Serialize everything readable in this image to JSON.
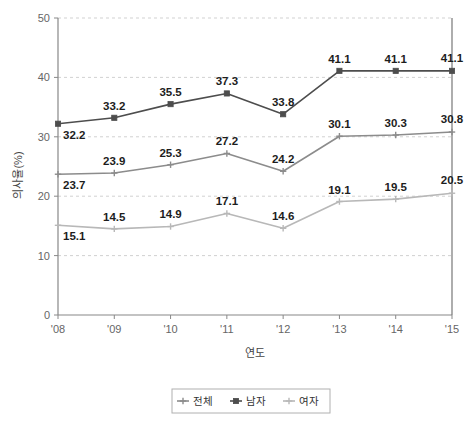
{
  "chart_data": {
    "type": "line",
    "title": "",
    "xlabel": "연도",
    "ylabel": "의사율(%)",
    "categories": [
      "'08",
      "'09",
      "'10",
      "'11",
      "'12",
      "'13",
      "'14",
      "'15"
    ],
    "ylim": [
      0,
      50
    ],
    "yticks": [
      "0",
      "10",
      "20",
      "30",
      "40",
      "50"
    ],
    "ytick_values": [
      0,
      10,
      20,
      30,
      40,
      50
    ],
    "grid": "horizontal-dashed",
    "legend_position": "bottom-center",
    "series": [
      {
        "name": "전체",
        "color": "#8c8c8c",
        "marker": "cross",
        "values": [
          23.7,
          23.9,
          25.3,
          27.2,
          24.2,
          30.1,
          30.3,
          30.8
        ],
        "labels": [
          "23.7",
          "23.9",
          "25.3",
          "27.2",
          "24.2",
          "30.1",
          "30.3",
          "30.8"
        ]
      },
      {
        "name": "남자",
        "color": "#4d4d4d",
        "marker": "square",
        "values": [
          32.2,
          33.2,
          35.5,
          37.3,
          33.8,
          41.1,
          41.1,
          41.1
        ],
        "labels": [
          "32.2",
          "33.2",
          "35.5",
          "37.3",
          "33.8",
          "41.1",
          "41.1",
          "41.1"
        ]
      },
      {
        "name": "여자",
        "color": "#b8b8b8",
        "marker": "cross",
        "values": [
          15.1,
          14.5,
          14.9,
          17.1,
          14.6,
          19.1,
          19.5,
          20.5
        ],
        "labels": [
          "15.1",
          "14.5",
          "14.9",
          "17.1",
          "14.6",
          "19.1",
          "19.5",
          "20.5"
        ]
      }
    ]
  },
  "legend": {
    "items": [
      {
        "label": "전체",
        "color": "#8c8c8c"
      },
      {
        "label": "남자",
        "color": "#4d4d4d"
      },
      {
        "label": "여자",
        "color": "#b8b8b8"
      }
    ]
  },
  "axes": {
    "x_title": "연도",
    "y_title": "의사율(%)"
  }
}
